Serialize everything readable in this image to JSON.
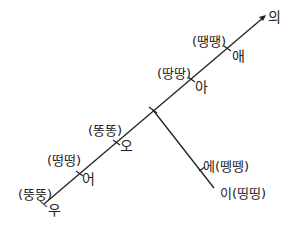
{
  "diagram": {
    "type": "vowel-line",
    "main_axis_end_label": "의",
    "main_axis": [
      {
        "vowel": "우",
        "example": "(뚱뚱)"
      },
      {
        "vowel": "어",
        "example": "(떵떵)"
      },
      {
        "vowel": "오",
        "example": "(똥똥)"
      },
      {
        "vowel": "아",
        "example": "(땅땅)"
      },
      {
        "vowel": "애",
        "example": "(땡땡)"
      }
    ],
    "branch": [
      {
        "label": "에(뗑뗑)"
      },
      {
        "label": "이(띵띵)"
      }
    ],
    "line_color": "#222222"
  }
}
